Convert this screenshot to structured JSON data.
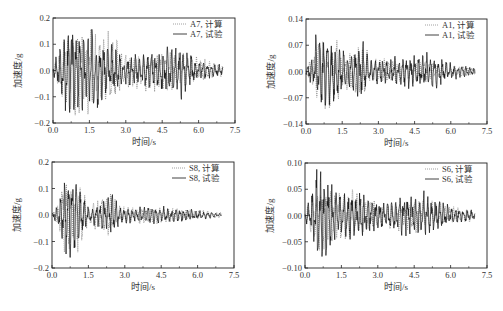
{
  "chart_data": [
    {
      "type": "line",
      "id": "A7",
      "frame": {
        "left": 53,
        "top": 18,
        "right": 235,
        "bottom": 123
      },
      "xlabel": "时间/s",
      "ylabel": "加速度/g",
      "xlim": [
        0,
        7.5
      ],
      "ylim": [
        -0.2,
        0.2
      ],
      "xticks": [
        "0.0",
        "1.5",
        "3.0",
        "4.5",
        "6.0",
        "7.5"
      ],
      "yticks": [
        "0.2",
        "0.1",
        "0.0",
        "-0.1",
        "-0.2"
      ],
      "ytick_values": [
        0.2,
        0.1,
        0.0,
        -0.1,
        -0.2
      ],
      "legend": [
        {
          "label": "A7, 计算",
          "style": "dotted"
        },
        {
          "label": "A7, 试验",
          "style": "solid"
        }
      ],
      "series": [
        {
          "name": "A7, 计算",
          "style": "dotted",
          "duration": 7.0,
          "peak_max": 0.16,
          "peak_min": -0.17,
          "seed": 11,
          "envelope": [
            [
              0,
              0.02
            ],
            [
              0.3,
              0.08
            ],
            [
              0.5,
              0.15
            ],
            [
              1.2,
              0.15
            ],
            [
              1.8,
              0.14
            ],
            [
              2.5,
              0.12
            ],
            [
              3.0,
              0.06
            ],
            [
              4.5,
              0.07
            ],
            [
              5.5,
              0.06
            ],
            [
              6.5,
              0.03
            ],
            [
              7.0,
              0.02
            ]
          ]
        },
        {
          "name": "A7, 试验",
          "style": "solid",
          "duration": 7.0,
          "peak_max": 0.19,
          "peak_min": -0.16,
          "seed": 3,
          "envelope": [
            [
              0,
              0.02
            ],
            [
              0.3,
              0.08
            ],
            [
              0.5,
              0.18
            ],
            [
              1.2,
              0.16
            ],
            [
              1.8,
              0.14
            ],
            [
              2.5,
              0.08
            ],
            [
              3.0,
              0.05
            ],
            [
              4.5,
              0.08
            ],
            [
              5.3,
              0.09
            ],
            [
              6.0,
              0.03
            ],
            [
              7.0,
              0.02
            ]
          ]
        }
      ]
    },
    {
      "type": "line",
      "id": "A1",
      "frame": {
        "left": 306,
        "top": 19,
        "right": 487,
        "bottom": 124
      },
      "xlabel": "时间/s",
      "ylabel": "加速度/g",
      "xlim": [
        0,
        7.5
      ],
      "ylim": [
        -0.14,
        0.14
      ],
      "xticks": [
        "0.0",
        "1.5",
        "3.0",
        "4.5",
        "6.0",
        "7.5"
      ],
      "yticks": [
        "0.14",
        "0.07",
        "0.00",
        "-0.07",
        "-0.14"
      ],
      "ytick_values": [
        0.14,
        0.07,
        0.0,
        -0.07,
        -0.14
      ],
      "legend": [
        {
          "label": "A1, 计算",
          "style": "dotted"
        },
        {
          "label": "A1, 试验",
          "style": "solid"
        }
      ],
      "series": [
        {
          "name": "A1, 计算",
          "style": "dotted",
          "duration": 7.0,
          "peak_max": 0.1,
          "peak_min": -0.1,
          "seed": 21,
          "envelope": [
            [
              0,
              0.01
            ],
            [
              0.3,
              0.05
            ],
            [
              0.6,
              0.1
            ],
            [
              1.2,
              0.1
            ],
            [
              1.6,
              0.04
            ],
            [
              2.4,
              0.08
            ],
            [
              2.6,
              0.03
            ],
            [
              4.5,
              0.03
            ],
            [
              5.5,
              0.02
            ],
            [
              7.0,
              0.01
            ]
          ]
        },
        {
          "name": "A1, 试验",
          "style": "solid",
          "duration": 7.0,
          "peak_max": 0.12,
          "peak_min": -0.09,
          "seed": 5,
          "envelope": [
            [
              0,
              0.01
            ],
            [
              0.3,
              0.05
            ],
            [
              0.5,
              0.12
            ],
            [
              1.2,
              0.08
            ],
            [
              1.8,
              0.05
            ],
            [
              2.4,
              0.07
            ],
            [
              2.6,
              0.03
            ],
            [
              4.5,
              0.04
            ],
            [
              5.2,
              0.05
            ],
            [
              6.0,
              0.02
            ],
            [
              7.0,
              0.01
            ]
          ]
        }
      ]
    },
    {
      "type": "line",
      "id": "S8",
      "frame": {
        "left": 52,
        "top": 162,
        "right": 234,
        "bottom": 268
      },
      "xlabel": "时间/s",
      "ylabel": "加速度/g",
      "xlim": [
        0,
        7.5
      ],
      "ylim": [
        -0.2,
        0.2
      ],
      "xticks": [
        "0.0",
        "1.5",
        "3.0",
        "4.5",
        "6.0",
        "7.5"
      ],
      "yticks": [
        "0.2",
        "0.1",
        "0.0",
        "-0.1",
        "-0.2"
      ],
      "ytick_values": [
        0.2,
        0.1,
        0.0,
        -0.1,
        -0.2
      ],
      "legend": [
        {
          "label": "S8, 计算",
          "style": "dotted"
        },
        {
          "label": "S8, 试验",
          "style": "solid"
        }
      ],
      "series": [
        {
          "name": "S8, 计算",
          "style": "dotted",
          "duration": 7.0,
          "peak_max": 0.15,
          "peak_min": -0.15,
          "seed": 31,
          "envelope": [
            [
              0,
              0.01
            ],
            [
              0.3,
              0.05
            ],
            [
              0.5,
              0.15
            ],
            [
              1.2,
              0.12
            ],
            [
              1.5,
              0.03
            ],
            [
              2.4,
              0.1
            ],
            [
              2.7,
              0.03
            ],
            [
              4.5,
              0.03
            ],
            [
              5.5,
              0.02
            ],
            [
              7.0,
              0.01
            ]
          ]
        },
        {
          "name": "S8, 试验",
          "style": "solid",
          "duration": 7.0,
          "peak_max": 0.14,
          "peak_min": -0.18,
          "seed": 7,
          "envelope": [
            [
              0,
              0.01
            ],
            [
              0.3,
              0.05
            ],
            [
              0.5,
              0.14
            ],
            [
              0.7,
              0.18
            ],
            [
              1.2,
              0.08
            ],
            [
              1.6,
              0.03
            ],
            [
              2.5,
              0.08
            ],
            [
              2.8,
              0.03
            ],
            [
              4.5,
              0.03
            ],
            [
              5.8,
              0.02
            ],
            [
              7.0,
              0.005
            ]
          ]
        }
      ]
    },
    {
      "type": "line",
      "id": "S6",
      "frame": {
        "left": 305,
        "top": 163,
        "right": 487,
        "bottom": 268
      },
      "xlabel": "时间/s",
      "ylabel": "加速度/g",
      "xlim": [
        0,
        7.5
      ],
      "ylim": [
        -0.1,
        0.1
      ],
      "xticks": [
        "0.0",
        "1.5",
        "3.0",
        "4.5",
        "6.0",
        "7.5"
      ],
      "yticks": [
        "0.10",
        "0.05",
        "0.00",
        "-0.05",
        "-0.10"
      ],
      "ytick_values": [
        0.1,
        0.05,
        0.0,
        -0.05,
        -0.1
      ],
      "legend": [
        {
          "label": "S6, 计算",
          "style": "dotted"
        },
        {
          "label": "S6, 试验",
          "style": "solid"
        }
      ],
      "series": [
        {
          "name": "S6, 计算",
          "style": "dotted",
          "duration": 7.0,
          "peak_max": 0.06,
          "peak_min": -0.07,
          "seed": 41,
          "envelope": [
            [
              0,
              0.01
            ],
            [
              0.3,
              0.04
            ],
            [
              0.6,
              0.07
            ],
            [
              1.2,
              0.05
            ],
            [
              2.5,
              0.04
            ],
            [
              3.0,
              0.02
            ],
            [
              5.0,
              0.03
            ],
            [
              6.0,
              0.015
            ],
            [
              7.0,
              0.01
            ]
          ]
        },
        {
          "name": "S6, 试验",
          "style": "solid",
          "duration": 7.0,
          "peak_max": 0.09,
          "peak_min": -0.095,
          "seed": 9,
          "envelope": [
            [
              0,
              0.01
            ],
            [
              0.3,
              0.04
            ],
            [
              0.5,
              0.095
            ],
            [
              1.0,
              0.06
            ],
            [
              1.5,
              0.04
            ],
            [
              2.4,
              0.04
            ],
            [
              3.0,
              0.03
            ],
            [
              4.8,
              0.04
            ],
            [
              5.2,
              0.04
            ],
            [
              6.0,
              0.015
            ],
            [
              7.0,
              0.01
            ]
          ]
        }
      ]
    }
  ]
}
